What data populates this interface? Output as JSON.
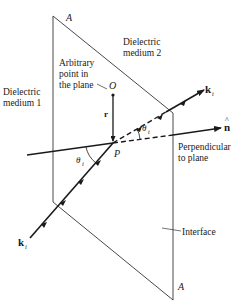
{
  "diagram": {
    "labels": {
      "corner_top": "A",
      "corner_bottom": "A",
      "medium_1_line1": "Dielectric",
      "medium_1_line2": "medium 1",
      "medium_2_line1": "Dielectric",
      "medium_2_line2": "medium 2",
      "arbitrary_line1": "Arbitrary",
      "arbitrary_line2": "point in",
      "arbitrary_line3": "the plane",
      "point_O": "O",
      "vector_r": "r",
      "point_P": "P",
      "k_incident": "k",
      "k_incident_sub": "i",
      "k_transmitted": "k",
      "k_transmitted_sub": "t",
      "normal": "n",
      "normal_hat": "^",
      "theta_incident": "θ",
      "theta_incident_sub": "i",
      "theta_transmitted": "θ",
      "theta_transmitted_sub": "t",
      "perpendicular_line1": "Perpendicular",
      "perpendicular_line2": "to plane",
      "interface": "Interface"
    },
    "colors": {
      "line": "#1a1a1a",
      "plane": "#333333",
      "background": "#ffffff"
    }
  }
}
